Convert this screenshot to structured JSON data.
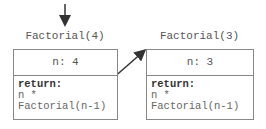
{
  "frames": [
    {
      "title": "Factorial(4)",
      "variable": "n: 4",
      "return_label": "return:",
      "return_line1": "n *",
      "return_line2": "Factorial(n-1)"
    },
    {
      "title": "Factorial(3)",
      "variable": "n: 3",
      "return_label": "return:",
      "return_line1": "n *",
      "return_line2": "Factorial(n-1)"
    }
  ],
  "colors": {
    "line": "#333333",
    "border": "#888888"
  }
}
